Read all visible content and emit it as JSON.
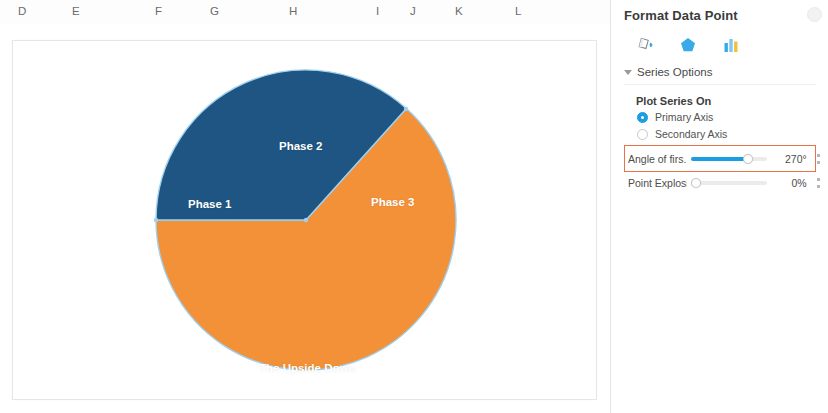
{
  "spreadsheet": {
    "column_headers": [
      {
        "label": "D",
        "x": 18
      },
      {
        "label": "E",
        "x": 72
      },
      {
        "label": "F",
        "x": 155
      },
      {
        "label": "G",
        "x": 210
      },
      {
        "label": "H",
        "x": 289
      },
      {
        "label": "I",
        "x": 376
      },
      {
        "label": "J",
        "x": 410
      },
      {
        "label": "K",
        "x": 455
      },
      {
        "label": "L",
        "x": 515
      }
    ]
  },
  "chart_data": {
    "type": "pie",
    "title": "",
    "categories": [
      "Phase 1",
      "Phase 2",
      "Phase 3",
      "The Upside Down"
    ],
    "values": [
      25,
      21,
      4,
      50
    ],
    "labels_shown": [
      "Phase 1",
      "Phase 2",
      "Phase 3",
      "The Upside Down"
    ],
    "colors": [
      "#1f5582",
      "#1f5582",
      "#1f5582",
      "#f29138"
    ],
    "start_angle_deg": 270,
    "point_explosion_pct": 0,
    "legend": "none",
    "grid": false,
    "slice_border_color": "#9fd0ef",
    "slices": [
      {
        "name": "Phase 1",
        "value": 25,
        "color": "#1f5582",
        "start_deg": 270,
        "end_deg": 360
      },
      {
        "name": "Phase 2",
        "value": 21,
        "color": "#1f5582",
        "start_deg": 0,
        "end_deg": 42
      },
      {
        "name": "Phase 3",
        "value": 4,
        "color": "#f29138",
        "start_deg": 42,
        "end_deg": 56
      },
      {
        "name": "The Upside Down",
        "value": 50,
        "color": "#f29138",
        "start_deg": 56,
        "end_deg": 270
      }
    ]
  },
  "panel": {
    "title": "Format Data Point",
    "close_icon": "close-icon",
    "icons": [
      {
        "name": "fill-and-line-icon",
        "glyph": "paint-bucket"
      },
      {
        "name": "effects-icon",
        "glyph": "pentagon"
      },
      {
        "name": "series-options-icon",
        "glyph": "bar-chart"
      }
    ],
    "section": {
      "header": "Series Options",
      "expanded": true,
      "plot_series_on_label": "Plot Series On",
      "radios": [
        {
          "label": "Primary Axis",
          "selected": true
        },
        {
          "label": "Secondary Axis",
          "selected": false
        }
      ],
      "sliders": [
        {
          "label": "Angle of firs...",
          "full_label": "Angle of first slice",
          "value": "270°",
          "fill_pct": 75,
          "highlighted": true,
          "accent": "#1b9de2"
        },
        {
          "label": "Point Explosi...",
          "full_label": "Point Explosion",
          "value": "0%",
          "fill_pct": 0,
          "highlighted": false,
          "accent": "#1b9de2"
        }
      ]
    },
    "highlight_color": "#e8734a"
  }
}
